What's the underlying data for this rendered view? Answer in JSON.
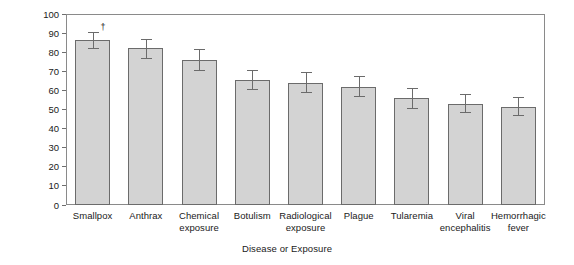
{
  "chart_data": {
    "type": "bar",
    "title": "",
    "xlabel": "Disease or Exposure",
    "ylabel": "Percentage",
    "ylim": [
      0,
      100
    ],
    "ytick_values": [
      0,
      10,
      20,
      30,
      40,
      50,
      60,
      70,
      80,
      90,
      100
    ],
    "ytick_labels": [
      "0",
      "10",
      "20",
      "30",
      "40",
      "50",
      "60",
      "70",
      "80",
      "90",
      "100"
    ],
    "grid": false,
    "legend": "none",
    "categories": [
      "Smallpox",
      "Anthrax",
      "Chemical\nexposure",
      "Botulism",
      "Radiological\nexposure",
      "Plague",
      "Tularemia",
      "Viral\nencephalitis",
      "Hemorrhagic\nfever"
    ],
    "values": [
      86.5,
      82.0,
      76.0,
      65.5,
      64.0,
      62.0,
      56.0,
      53.0,
      51.5
    ],
    "error_low": [
      82.0,
      77.0,
      70.5,
      60.5,
      59.0,
      57.0,
      51.0,
      48.5,
      47.0
    ],
    "error_high": [
      90.5,
      87.0,
      81.5,
      70.5,
      69.5,
      67.5,
      61.0,
      58.0,
      56.5
    ],
    "annotations": [
      {
        "category": "Smallpox",
        "symbol": "†"
      }
    ],
    "colors": {
      "bar_fill": "#d3d3d3",
      "bar_edge": "#6b6b6b",
      "axis": "#8a8a8a",
      "text": "#1a1a1a"
    }
  }
}
